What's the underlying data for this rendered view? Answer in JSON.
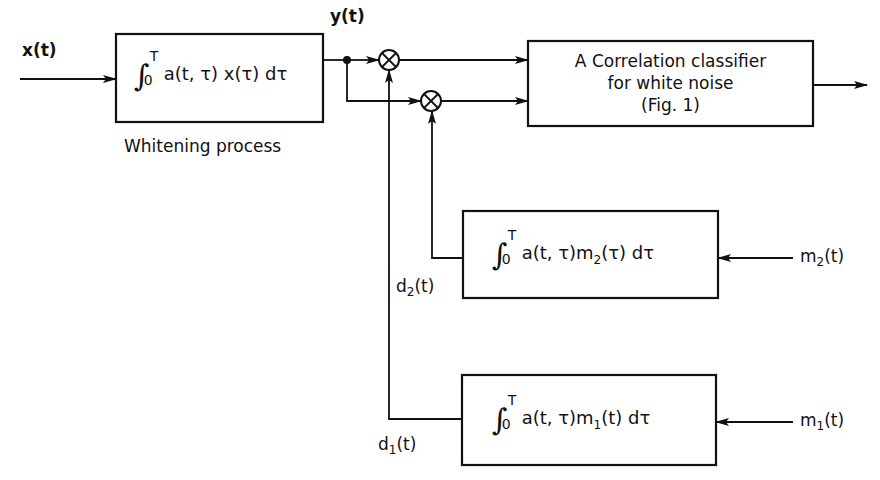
{
  "diagram": {
    "input_signal": "x(t)",
    "whitening_node_output": "y(t)",
    "whitening_block": {
      "integral_upper": "T",
      "integral_lower": "0",
      "expression": "a(t, τ) x(τ) dτ",
      "caption": "Whitening process"
    },
    "classifier_block": {
      "lines": [
        "A Correlation classifier",
        "for white noise",
        "(Fig. 1)"
      ]
    },
    "filter_m2_block": {
      "integral_upper": "T",
      "integral_lower": "0",
      "expression_prefix": "a(t, τ)m",
      "expression_sub": "2",
      "expression_suffix": "(τ)  dτ",
      "input_label": "m",
      "input_sub": "2",
      "input_suffix": "(t)",
      "output_label": "d",
      "output_sub": "2",
      "output_suffix": "(t)"
    },
    "filter_m1_block": {
      "integral_upper": "T",
      "integral_lower": "0",
      "expression_prefix": "a(t, τ)m",
      "expression_sub": "1",
      "expression_suffix": "(t)  dτ",
      "input_label": "m",
      "input_sub": "1",
      "input_suffix": "(t)",
      "output_label": "d",
      "output_sub": "1",
      "output_suffix": "(t)"
    },
    "multiplier_symbol": "⊗",
    "line_color": "#111111"
  }
}
